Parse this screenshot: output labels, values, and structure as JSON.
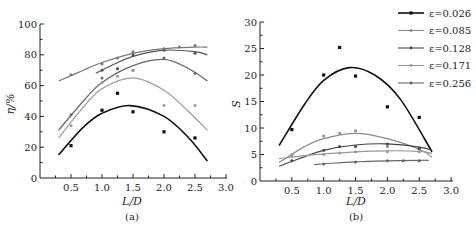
{
  "chart_data": [
    {
      "type": "scatter",
      "panel": "(a)",
      "xlabel": "L/D",
      "ylabel": "η/%",
      "xlim": [
        0,
        3.0
      ],
      "ylim": [
        0,
        100
      ],
      "xticks": [
        "0.5",
        "1.0",
        "1.5",
        "2.0",
        "2.5",
        "3.0"
      ],
      "yticks": [
        "0",
        "20",
        "40",
        "60",
        "80",
        "100"
      ],
      "grid": false,
      "series": [
        {
          "name": "ε=0.026",
          "color": "#111111",
          "points": [
            [
              0.5,
              21
            ],
            [
              1.0,
              44
            ],
            [
              1.25,
              55
            ],
            [
              1.5,
              43
            ],
            [
              2.0,
              30
            ],
            [
              2.5,
              26
            ]
          ],
          "fit": [
            [
              0.3,
              15
            ],
            [
              0.7,
              33
            ],
            [
              1.0,
              42
            ],
            [
              1.45,
              47
            ],
            [
              2.0,
              40
            ],
            [
              2.4,
              26
            ],
            [
              2.7,
              11
            ]
          ]
        },
        {
          "name": "ε=0.085",
          "color": "#666666",
          "points": [
            [
              0.5,
              41
            ],
            [
              1.0,
              65
            ],
            [
              1.25,
              71
            ],
            [
              1.5,
              70
            ],
            [
              2.0,
              78
            ],
            [
              2.5,
              68
            ]
          ],
          "fit": [
            [
              0.3,
              31
            ],
            [
              0.7,
              50
            ],
            [
              1.0,
              62
            ],
            [
              1.5,
              73
            ],
            [
              2.0,
              77
            ],
            [
              2.4,
              71
            ],
            [
              2.7,
              63
            ]
          ]
        },
        {
          "name": "ε=0.128",
          "color": "#555555",
          "points": [
            [
              1.0,
              70
            ],
            [
              1.25,
              71
            ],
            [
              1.5,
              80
            ],
            [
              2.0,
              83
            ],
            [
              2.5,
              81
            ]
          ],
          "fit": [
            [
              0.9,
              68
            ],
            [
              1.2,
              74
            ],
            [
              1.5,
              79
            ],
            [
              2.0,
              83
            ],
            [
              2.5,
              82
            ],
            [
              2.7,
              80
            ]
          ]
        },
        {
          "name": "ε=0.171",
          "color": "#9a9a9a",
          "points": [
            [
              0.5,
              34
            ],
            [
              1.0,
              62
            ],
            [
              1.25,
              66
            ],
            [
              1.5,
              70
            ],
            [
              2.0,
              47
            ],
            [
              2.5,
              47
            ]
          ],
          "fit": [
            [
              0.3,
              26
            ],
            [
              0.7,
              46
            ],
            [
              1.0,
              58
            ],
            [
              1.5,
              65
            ],
            [
              2.0,
              57
            ],
            [
              2.4,
              43
            ],
            [
              2.7,
              31
            ]
          ]
        },
        {
          "name": "ε=0.256",
          "color": "#777777",
          "points": [
            [
              0.5,
              67
            ],
            [
              1.0,
              74
            ],
            [
              1.25,
              78
            ],
            [
              1.5,
              82
            ],
            [
              2.0,
              84
            ],
            [
              2.25,
              85
            ],
            [
              2.5,
              86
            ]
          ],
          "fit": [
            [
              0.3,
              63
            ],
            [
              0.7,
              70
            ],
            [
              1.0,
              75
            ],
            [
              1.5,
              81
            ],
            [
              2.0,
              84
            ],
            [
              2.5,
              85
            ],
            [
              2.7,
              85
            ]
          ]
        }
      ]
    },
    {
      "type": "scatter",
      "panel": "(b)",
      "xlabel": "L/D",
      "ylabel": "S",
      "xlim": [
        0,
        3.0
      ],
      "ylim": [
        0,
        30
      ],
      "xticks": [
        "0.5",
        "1.0",
        "1.5",
        "2.0",
        "2.5",
        "3.0"
      ],
      "yticks": [
        "0",
        "5",
        "10",
        "15",
        "20",
        "25",
        "30"
      ],
      "grid": false,
      "legend_position": "upper right",
      "series": [
        {
          "name": "ε=0.026",
          "color": "#111111",
          "points": [
            [
              0.5,
              9.7
            ],
            [
              1.0,
              20.0
            ],
            [
              1.25,
              25.2
            ],
            [
              1.5,
              19.8
            ],
            [
              2.0,
              14.0
            ],
            [
              2.5,
              12.0
            ]
          ],
          "fit": [
            [
              0.3,
              6.7
            ],
            [
              0.7,
              14.5
            ],
            [
              1.0,
              19.0
            ],
            [
              1.4,
              21.4
            ],
            [
              1.8,
              20.0
            ],
            [
              2.2,
              15.5
            ],
            [
              2.7,
              5.5
            ]
          ]
        },
        {
          "name": "ε=0.085",
          "color": "#8a8a8a",
          "points": [
            [
              0.5,
              4.8
            ],
            [
              1.0,
              8.5
            ],
            [
              1.25,
              9.0
            ],
            [
              1.5,
              9.5
            ],
            [
              2.0,
              6.5
            ],
            [
              2.5,
              6.0
            ]
          ],
          "fit": [
            [
              0.3,
              3.5
            ],
            [
              0.7,
              6.5
            ],
            [
              1.0,
              8.0
            ],
            [
              1.5,
              9.0
            ],
            [
              2.0,
              8.0
            ],
            [
              2.5,
              6.0
            ],
            [
              2.7,
              4.5
            ]
          ]
        },
        {
          "name": "ε=0.128",
          "color": "#444444",
          "points": [
            [
              0.5,
              3.8
            ],
            [
              1.0,
              5.8
            ],
            [
              1.25,
              6.5
            ],
            [
              1.5,
              6.5
            ],
            [
              2.0,
              7.0
            ],
            [
              2.5,
              6.2
            ]
          ],
          "fit": [
            [
              0.3,
              2.8
            ],
            [
              0.7,
              4.6
            ],
            [
              1.0,
              5.8
            ],
            [
              1.5,
              6.8
            ],
            [
              2.0,
              7.0
            ],
            [
              2.5,
              6.4
            ],
            [
              2.7,
              5.8
            ]
          ]
        },
        {
          "name": "ε=0.171",
          "color": "#999999",
          "points": [
            [
              0.5,
              5.0
            ],
            [
              1.0,
              5.0
            ],
            [
              1.25,
              5.3
            ],
            [
              1.5,
              5.5
            ],
            [
              2.0,
              5.5
            ],
            [
              2.5,
              5.5
            ]
          ],
          "fit": [
            [
              0.3,
              4.2
            ],
            [
              0.7,
              4.8
            ],
            [
              1.0,
              5.1
            ],
            [
              1.5,
              5.5
            ],
            [
              2.0,
              5.7
            ],
            [
              2.5,
              5.6
            ],
            [
              2.7,
              5.2
            ]
          ]
        },
        {
          "name": "ε=0.256",
          "color": "#666666",
          "points": [
            [
              1.0,
              3.2
            ],
            [
              1.5,
              3.6
            ],
            [
              2.0,
              3.8
            ],
            [
              2.25,
              3.8
            ],
            [
              2.5,
              3.8
            ]
          ],
          "fit": [
            [
              0.85,
              3.1
            ],
            [
              1.2,
              3.4
            ],
            [
              1.5,
              3.6
            ],
            [
              2.0,
              3.8
            ],
            [
              2.5,
              3.9
            ],
            [
              2.65,
              3.9
            ]
          ]
        }
      ]
    }
  ],
  "legend": {
    "items": [
      {
        "label": "ε=0.026",
        "color": "#111111"
      },
      {
        "label": "ε=0.085",
        "color": "#8a8a8a"
      },
      {
        "label": "ε=0.128",
        "color": "#444444"
      },
      {
        "label": "ε=0.171",
        "color": "#999999"
      },
      {
        "label": "ε=0.256",
        "color": "#666666"
      }
    ]
  },
  "labels": {
    "a_xlabel": "L/D",
    "a_ylabel": "η/%",
    "a_panel": "(a)",
    "b_xlabel": "L/D",
    "b_ylabel": "S",
    "b_panel": "(b)"
  }
}
